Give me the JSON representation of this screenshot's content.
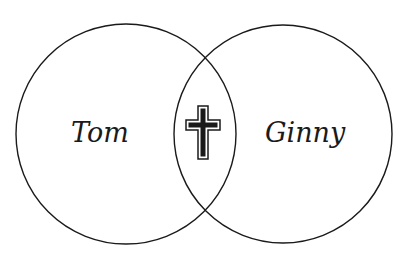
{
  "diagram": {
    "type": "venn",
    "sets": [
      {
        "label": "Tom",
        "cx": 126,
        "cy": 134,
        "r": 110
      },
      {
        "label": "Ginny",
        "cx": 283,
        "cy": 134,
        "r": 109
      }
    ],
    "intersection": {
      "icon": "cross-icon"
    },
    "colors": {
      "stroke": "#1a1a1a",
      "background": "#ffffff",
      "cross_fill": "#1a1a1a"
    }
  }
}
